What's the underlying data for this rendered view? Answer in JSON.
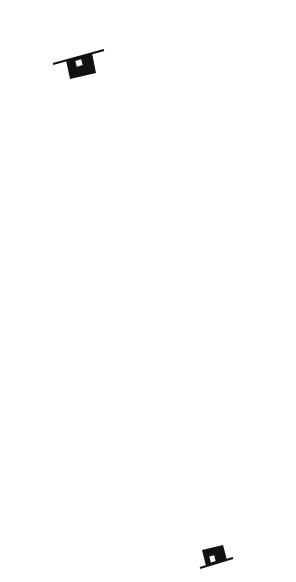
{
  "page_number": "67",
  "top_node": {
    "icon": "house-icon",
    "apex": [
      85,
      77
    ]
  },
  "bottom_node": {
    "icon": "house-icon",
    "apex": [
      211,
      544
    ]
  },
  "months": [
    {
      "tongan": "Lihamu'a",
      "start_date": "Dec. 22",
      "end_date": "Jan. 21",
      "top_dot": [
        23,
        222
      ],
      "bottom_dot": [
        88,
        449
      ]
    },
    {
      "tongan": "Hilingamea'a",
      "start_date": "Jan. 21",
      "end_date": "Feb. 21",
      "top_dot": [
        56,
        212
      ],
      "bottom_dot": [
        118,
        440
      ]
    },
    {
      "tongan": "Vaimu'a",
      "start_date": "Feb. 21",
      "end_date": "Mar. 21",
      "top_dot": [
        88,
        203
      ],
      "bottom_dot": [
        150,
        432
      ]
    },
    {
      "tongan": "Fā'afu'ofua",
      "start_date": "Mar. 21",
      "end_date": "Apr. 21",
      "top_dot": [
        117,
        194
      ],
      "bottom_dot": [
        180,
        424
      ]
    },
    {
      "tongan": "Pakaafumate",
      "start_date": "Apr. 21",
      "end_date": "May 21",
      "top_dot": [
        151,
        184
      ],
      "bottom_dot": [
        211,
        416
      ]
    },
    {
      "tongan": "Lihamui",
      "start_date": "May 21",
      "end_date": "June 21",
      "top_dot": [
        179,
        175
      ],
      "bottom_dot": [
        243,
        407
      ]
    },
    {
      "tongan": "'Aoao",
      "start_date": "June 21",
      "end_date": "July 21",
      "top_dot": [
        209,
        165
      ],
      "bottom_dot": [
        273,
        398
      ]
    }
  ],
  "upper_labels": [
    {
      "text": "Dec. 22",
      "x": 44,
      "y": 172,
      "rot": 66
    },
    {
      "text": "Jan. 21",
      "x": 67,
      "y": 165,
      "rot": 74
    },
    {
      "text": "Feb. 21",
      "x": 89,
      "y": 156,
      "rot": 82
    },
    {
      "text": "Mars 21a.",
      "x": 108,
      "y": 150,
      "rot": 68
    },
    {
      "text": "Apr. 21",
      "x": 131,
      "y": 147,
      "rot": 55
    },
    {
      "text": "May 21",
      "x": 159,
      "y": 143,
      "rot": 42
    },
    {
      "text": "June 21",
      "x": 184,
      "y": 133,
      "rot": 29
    }
  ],
  "middle_names": [
    {
      "text": "Lihamu'a.",
      "x": 58,
      "y": 274,
      "rot": 71
    },
    {
      "text": "Hilingamea'a",
      "x": 87,
      "y": 258,
      "rot": 71
    },
    {
      "text": "Vaimu'a",
      "x": 114,
      "y": 245,
      "rot": 71
    },
    {
      "text": "Fā'afu'ofua'a",
      "x": 148,
      "y": 236,
      "rot": 71
    },
    {
      "text": "Pakaafumate",
      "x": 178,
      "y": 228,
      "rot": 71
    },
    {
      "text": "Lihamui",
      "x": 205,
      "y": 208,
      "rot": 71
    },
    {
      "text": "Hilingakelekele",
      "x": 92,
      "y": 400,
      "rot": 71
    },
    {
      "text": "'Uluenga",
      "x": 125,
      "y": 380,
      "rot": 71
    },
    {
      "text": "Tu'utuamanga",
      "x": 155,
      "y": 362,
      "rot": 71
    },
    {
      "text": "Vaimui",
      "x": 178,
      "y": 352,
      "rot": 71
    },
    {
      "text": "Fakaafumui",
      "x": 212,
      "y": 347,
      "rot": 71
    },
    {
      "text": "'Aoao",
      "x": 238,
      "y": 330,
      "rot": 71
    }
  ],
  "lower_labels": [
    {
      "text": "Dec. 22",
      "x": 120,
      "y": 467,
      "rot": 32
    },
    {
      "text": "Nov. 21",
      "x": 142,
      "y": 456,
      "rot": 45
    },
    {
      "text": "Oct. 21",
      "x": 170,
      "y": 451,
      "rot": 56
    },
    {
      "text": "Sept. 23",
      "x": 197,
      "y": 450,
      "rot": 70
    },
    {
      "text": "Aug. 21",
      "x": 218,
      "y": 437,
      "rot": 90
    },
    {
      "text": "July 21",
      "x": 246,
      "y": 435,
      "rot": 103
    },
    {
      "text": "June 21",
      "x": 275,
      "y": 418,
      "rot": 115
    }
  ]
}
